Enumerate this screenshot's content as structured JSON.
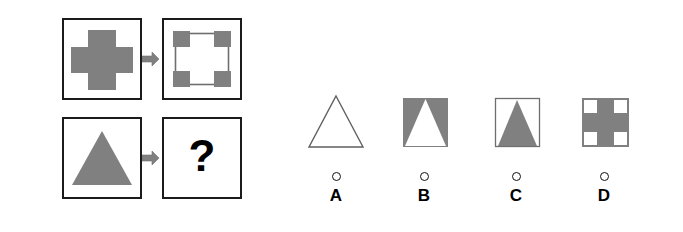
{
  "puzzle": {
    "type": "visual-analogy-matrix",
    "colors": {
      "shape_fill": "#808080",
      "outline": "#1b1b1b",
      "thin_outline": "#6e6e6e",
      "background": "#ffffff",
      "arrow": "#808080",
      "text": "#000000"
    },
    "matrix": {
      "rows": [
        {
          "name": "row-1",
          "prompt": {
            "shape": "cross",
            "fill": "solid-gray",
            "label": "gray cross"
          },
          "arrow": "arrow-right-icon",
          "answer": {
            "shape": "square-outline-with-gray-corners",
            "fill": "inverse",
            "label": "square outline with gray corner squares"
          }
        },
        {
          "name": "row-2",
          "prompt": {
            "shape": "triangle",
            "fill": "solid-gray",
            "label": "gray triangle"
          },
          "arrow": "arrow-right-icon",
          "answer": {
            "shape": "unknown",
            "fill": "none",
            "label": "?"
          }
        }
      ],
      "question_mark": "?"
    },
    "options": [
      {
        "id": "A",
        "label": "A",
        "shape": "triangle-outline",
        "description": "plain triangle outline, unfilled, no surrounding square",
        "selected": false
      },
      {
        "id": "B",
        "label": "B",
        "shape": "gray-square-with-white-triangle",
        "description": "gray square with white triangle cut out of the center",
        "selected": false
      },
      {
        "id": "C",
        "label": "C",
        "shape": "square-outline-with-gray-triangle",
        "description": "thin square outline containing a solid gray triangle",
        "selected": false
      },
      {
        "id": "D",
        "label": "D",
        "shape": "gray-square-with-white-corners",
        "description": "gray square with white notches cut from all four corners",
        "selected": false
      }
    ]
  }
}
